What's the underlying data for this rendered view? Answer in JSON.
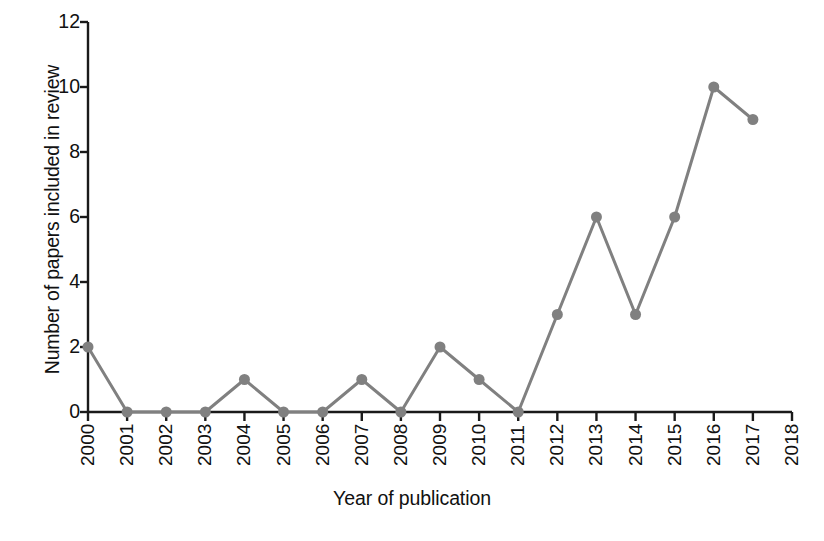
{
  "chart_data": {
    "type": "line",
    "title": "",
    "xlabel": "Year of publication",
    "ylabel": "Number of papers included in review",
    "categories": [
      2000,
      2001,
      2002,
      2003,
      2004,
      2005,
      2006,
      2007,
      2008,
      2009,
      2010,
      2011,
      2012,
      2013,
      2014,
      2015,
      2016,
      2017
    ],
    "values": [
      2,
      0,
      0,
      0,
      1,
      0,
      0,
      1,
      0,
      2,
      1,
      0,
      3,
      6,
      3,
      6,
      10,
      9
    ],
    "x_tick_labels": [
      "2000",
      "2001",
      "2002",
      "2003",
      "2004",
      "2005",
      "2006",
      "2007",
      "2008",
      "2009",
      "2010",
      "2011",
      "2012",
      "2013",
      "2014",
      "2015",
      "2016",
      "2017",
      "2018"
    ],
    "y_tick_labels": [
      "0",
      "2",
      "4",
      "6",
      "8",
      "10",
      "12"
    ],
    "y_ticks": [
      0,
      2,
      4,
      6,
      8,
      10,
      12
    ],
    "xlim": [
      2000,
      2018
    ],
    "ylim": [
      0,
      12
    ],
    "grid": false,
    "legend": null,
    "series_color": "#808080",
    "axis_color": "#1a1a1a",
    "marker": "circle",
    "marker_size": 11,
    "line_width": 3
  },
  "figure": {
    "background_color": "#ffffff",
    "caption_partial": ""
  }
}
